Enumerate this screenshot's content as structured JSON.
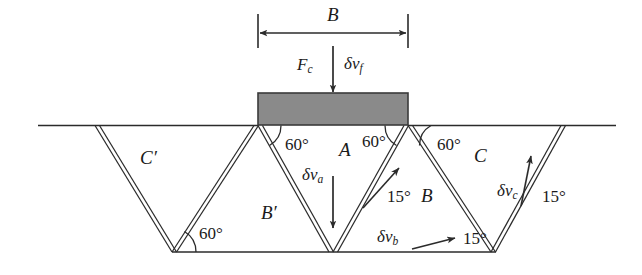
{
  "figure": {
    "type": "engineering-diagram",
    "colors": {
      "line": "#2b2b2b",
      "footing_fill": "#8a8a8a",
      "footing_stroke": "#3a3a3a",
      "text": "#1a1a1a"
    }
  },
  "dimension": {
    "width_label": "B"
  },
  "load": {
    "force_label": "F",
    "force_sub": "c",
    "velocity_label": "δv",
    "velocity_sub": "f"
  },
  "angles": {
    "a1": "60°",
    "a2": "60°",
    "a3": "60°",
    "a4": "60°",
    "a5": "15°",
    "a6": "15°",
    "a7": "15°"
  },
  "regions": {
    "r_c_prime": "C′",
    "r_b_prime": "B′",
    "r_a": "A",
    "r_b": "B",
    "r_c": "C"
  },
  "velocities": {
    "va_label": "δv",
    "va_sub": "a",
    "vb_label": "δv",
    "vb_sub": "b",
    "vc_label": "δv",
    "vc_sub": "c"
  },
  "geometry_note": {
    "ground_line": "horizontal ground surface",
    "bottom_line": "horizontal rupture base"
  }
}
